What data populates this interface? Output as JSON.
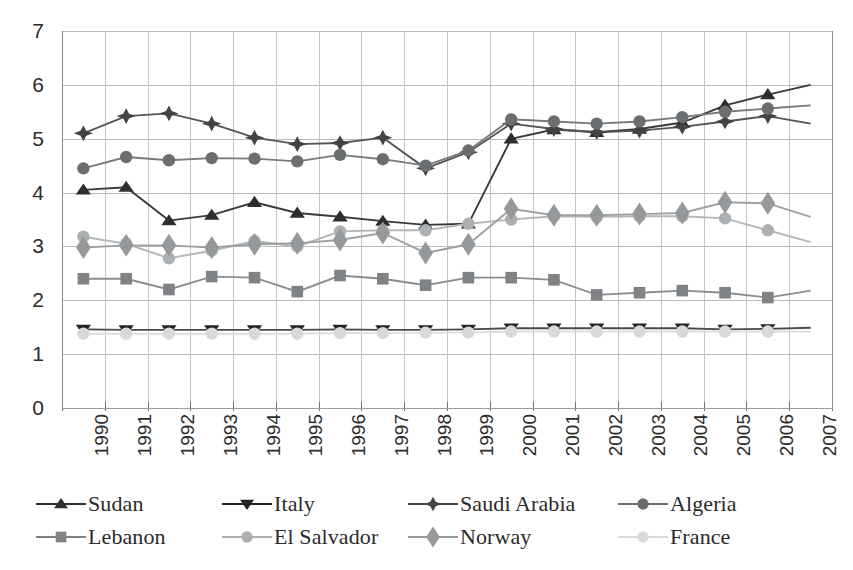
{
  "chart_data": {
    "type": "line",
    "title": "",
    "subtitle": "",
    "xlabel": "",
    "ylabel": "",
    "xlim": [
      1990,
      2007
    ],
    "ylim": [
      0,
      7
    ],
    "yticks": [
      0,
      1,
      2,
      3,
      4,
      5,
      6,
      7
    ],
    "grid": true,
    "legend_position": "bottom",
    "legend_columns": 4,
    "x": [
      1990,
      1991,
      1992,
      1993,
      1994,
      1995,
      1996,
      1997,
      1998,
      1999,
      2000,
      2001,
      2002,
      2003,
      2004,
      2005,
      2006,
      2007
    ],
    "categories": [
      "1990",
      "1991",
      "1992",
      "1993",
      "1994",
      "1995",
      "1996",
      "1997",
      "1998",
      "1999",
      "2000",
      "2001",
      "2002",
      "2003",
      "2004",
      "2005",
      "2006",
      "2007"
    ],
    "series": [
      {
        "name": "Sudan",
        "marker": "triangle-up",
        "color": "#2e2e2e",
        "line_color": "#3a3a3a",
        "values": [
          4.05,
          4.1,
          3.48,
          3.58,
          3.82,
          3.62,
          3.55,
          3.47,
          3.4,
          3.42,
          5.0,
          5.17,
          5.12,
          5.18,
          5.3,
          5.62,
          5.82,
          6.0
        ]
      },
      {
        "name": "Italy",
        "marker": "triangle-down",
        "color": "#232323",
        "line_color": "#4a4a4a",
        "values": [
          1.46,
          1.45,
          1.45,
          1.45,
          1.45,
          1.45,
          1.46,
          1.45,
          1.45,
          1.46,
          1.48,
          1.48,
          1.48,
          1.48,
          1.48,
          1.46,
          1.47,
          1.49
        ]
      },
      {
        "name": "Saudi Arabia",
        "marker": "star-plus",
        "color": "#434343",
        "line_color": "#555555",
        "values": [
          5.1,
          5.42,
          5.47,
          5.28,
          5.02,
          4.9,
          4.92,
          5.02,
          4.45,
          4.75,
          5.28,
          5.18,
          5.12,
          5.15,
          5.22,
          5.32,
          5.42,
          5.28
        ]
      },
      {
        "name": "Algeria",
        "marker": "circle",
        "color": "#6b6e70",
        "line_color": "#77797b",
        "values": [
          4.45,
          4.66,
          4.6,
          4.64,
          4.63,
          4.58,
          4.7,
          4.62,
          4.5,
          4.78,
          5.36,
          5.32,
          5.28,
          5.32,
          5.4,
          5.5,
          5.56,
          5.62
        ]
      },
      {
        "name": "Lebanon",
        "marker": "square",
        "color": "#808386",
        "line_color": "#8a8d90",
        "values": [
          2.4,
          2.4,
          2.2,
          2.44,
          2.42,
          2.16,
          2.46,
          2.4,
          2.28,
          2.42,
          2.42,
          2.38,
          2.1,
          2.14,
          2.18,
          2.14,
          2.05,
          2.18
        ]
      },
      {
        "name": "El Salvador",
        "marker": "circle",
        "color": "#adb0b2",
        "line_color": "#b4b7b9",
        "values": [
          3.18,
          3.05,
          2.78,
          2.92,
          3.1,
          3.0,
          3.28,
          3.3,
          3.3,
          3.42,
          3.5,
          3.56,
          3.55,
          3.56,
          3.56,
          3.52,
          3.3,
          3.08
        ]
      },
      {
        "name": "Norway",
        "marker": "diamond",
        "color": "#96999b",
        "line_color": "#9ea1a3",
        "values": [
          2.98,
          3.02,
          3.02,
          2.98,
          3.04,
          3.06,
          3.12,
          3.25,
          2.88,
          3.04,
          3.7,
          3.58,
          3.58,
          3.6,
          3.62,
          3.82,
          3.8,
          3.55
        ]
      },
      {
        "name": "France",
        "marker": "circle",
        "color": "#d7d9da",
        "line_color": "#dcdede",
        "values": [
          1.38,
          1.38,
          1.38,
          1.38,
          1.38,
          1.38,
          1.39,
          1.39,
          1.4,
          1.4,
          1.42,
          1.42,
          1.42,
          1.42,
          1.42,
          1.42,
          1.42,
          1.42
        ]
      }
    ]
  },
  "legend": {
    "items": [
      {
        "label": "Sudan",
        "marker": "triangle-up",
        "color": "#2e2e2e"
      },
      {
        "label": "Italy",
        "marker": "triangle-down",
        "color": "#232323"
      },
      {
        "label": "Saudi Arabia",
        "marker": "star-plus",
        "color": "#434343"
      },
      {
        "label": "Algeria",
        "marker": "circle",
        "color": "#6b6e70"
      },
      {
        "label": "Lebanon",
        "marker": "square",
        "color": "#808386"
      },
      {
        "label": "El Salvador",
        "marker": "circle",
        "color": "#adb0b2"
      },
      {
        "label": "Norway",
        "marker": "diamond",
        "color": "#96999b"
      },
      {
        "label": "France",
        "marker": "circle",
        "color": "#d7d9da"
      }
    ]
  },
  "colors": {
    "gridline": "#b9bcbe",
    "axis": "#888b8d",
    "text": "#2b2b2b",
    "background": "#ffffff"
  }
}
